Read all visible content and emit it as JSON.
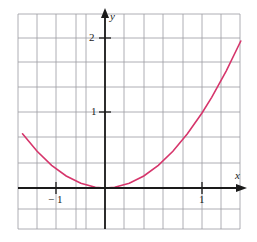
{
  "figure": {
    "name": "parabola-graph",
    "background_color": "#ffffff",
    "width": 257,
    "height": 242
  },
  "axes": {
    "x_label": "x",
    "y_label": "y",
    "axis_color": "#1a1a1a",
    "grid_color": "#8c8c92",
    "grid_visible": true
  },
  "ticks": {
    "y_two": "2",
    "y_one": "1",
    "x_one": "1",
    "x_minus_one": "− 1"
  },
  "chart_data": {
    "type": "line",
    "title": "",
    "xlabel": "x",
    "ylabel": "y",
    "curve_color": "#d6356b",
    "grid": true,
    "legend": "none",
    "xlim": [
      -1.6,
      1.6
    ],
    "ylim": [
      -0.6,
      2.6
    ],
    "xticks": [
      -1,
      1
    ],
    "xtick_labels": [
      "− 1",
      "1"
    ],
    "yticks": [
      1,
      2
    ],
    "ytick_labels": [
      "1",
      "2"
    ],
    "series": [
      {
        "name": "y = x^2",
        "equation": "y = x^2",
        "x": [
          -1.55,
          -1.4,
          -1.25,
          -1.1,
          -1.0,
          -0.85,
          -0.7,
          -0.55,
          -0.4,
          -0.25,
          -0.1,
          0.0,
          0.1,
          0.25,
          0.4,
          0.55,
          0.7,
          0.85,
          1.0,
          1.1,
          1.25,
          1.4,
          1.55
        ],
        "values": [
          2.4,
          1.96,
          1.5625,
          1.21,
          1.0,
          0.7225,
          0.49,
          0.3025,
          0.16,
          0.0625,
          0.01,
          0.0,
          0.01,
          0.0625,
          0.16,
          0.3025,
          0.49,
          0.7225,
          1.0,
          1.21,
          1.5625,
          1.96,
          2.4
        ]
      }
    ]
  }
}
